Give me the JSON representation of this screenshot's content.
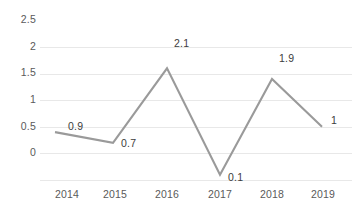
{
  "chart_data": {
    "type": "line",
    "title": "",
    "xlabel": "",
    "ylabel": "",
    "categories": [
      "2014",
      "2015",
      "2016",
      "2017",
      "2018",
      "2019"
    ],
    "values": [
      0.9,
      0.7,
      2.1,
      0.1,
      1.9,
      1
    ],
    "point_labels": [
      "0.9",
      "0.7",
      "2.1",
      "0.1",
      "1.9",
      "1"
    ],
    "yticks": [
      "0",
      "0.5",
      "1",
      "1.5",
      "2",
      "2.5"
    ],
    "ytick_values": [
      0,
      0.5,
      1,
      1.5,
      2,
      2.5
    ],
    "ylim": [
      0,
      2.5
    ],
    "grid": true,
    "legend": "none",
    "series": [
      {
        "name": "",
        "values": [
          0.9,
          0.7,
          2.1,
          0.1,
          1.9,
          1
        ],
        "color": "#9a9a9a"
      }
    ],
    "colors": {
      "line": "#9a9a9a",
      "grid": "#e8e8e8",
      "tick_text": "#5a5a5a",
      "label_text": "#3c3c3c",
      "background": "#ffffff"
    }
  }
}
